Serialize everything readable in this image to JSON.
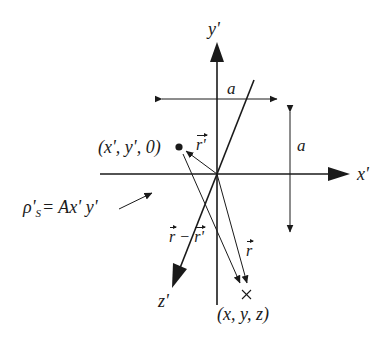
{
  "figure": {
    "axes": {
      "x_label": "x'",
      "y_label": "y'",
      "z_label": "z'"
    },
    "dimensions": {
      "horizontal_label": "a",
      "vertical_label": "a"
    },
    "source_point": {
      "label": "(x', y', 0)",
      "marker": "filled-dot"
    },
    "field_point": {
      "label": "(x, y, z)",
      "marker": "cross"
    },
    "vectors": {
      "r_prime": "r'",
      "r": "r",
      "r_minus_r_prime": {
        "a": "r",
        "op": "−",
        "b": "r'"
      }
    },
    "charge_density": {
      "lhs": "ρ'",
      "subscript": "S",
      "rhs": "= Ax' y'"
    },
    "colors": {
      "ink": "#1a1a1a",
      "background": "#ffffff"
    }
  }
}
